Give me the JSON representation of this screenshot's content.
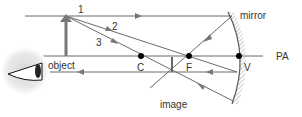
{
  "diagram": {
    "labels": {
      "ray1": "1",
      "ray2": "2",
      "ray3": "3",
      "mirror": "mirror",
      "principal_axis": "PA",
      "object": "object",
      "center": "C",
      "focus": "F",
      "vertex": "V",
      "image": "image"
    },
    "colors": {
      "line": "#6b6b6b",
      "object": "#777777",
      "point": "#000000",
      "text": "#333333"
    }
  }
}
